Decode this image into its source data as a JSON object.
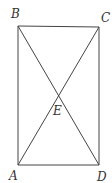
{
  "diagram": {
    "type": "geometry-figure",
    "points": {
      "A": {
        "label": "A",
        "x": 18,
        "y": 165,
        "label_x": 9,
        "label_y": 180
      },
      "B": {
        "label": "B",
        "x": 18,
        "y": 26,
        "label_x": 11,
        "label_y": 18
      },
      "C": {
        "label": "C",
        "x": 99,
        "y": 27,
        "label_x": 101,
        "label_y": 22
      },
      "D": {
        "label": "D",
        "x": 99,
        "y": 165,
        "label_x": 97,
        "label_y": 181
      },
      "E": {
        "label": "E",
        "x": 58,
        "y": 89,
        "label_x": 53,
        "label_y": 115
      }
    },
    "segments": [
      {
        "from": "A",
        "to": "B"
      },
      {
        "from": "B",
        "to": "C"
      },
      {
        "from": "C",
        "to": "D"
      },
      {
        "from": "D",
        "to": "A"
      },
      {
        "from": "A",
        "to": "C"
      },
      {
        "from": "B",
        "to": "D"
      }
    ],
    "colors": {
      "line": "#444444",
      "label": "#333333",
      "background": "#ffffff"
    }
  }
}
